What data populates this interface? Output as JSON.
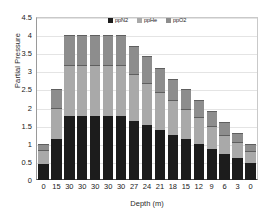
{
  "chart_data": {
    "type": "bar",
    "stacked": true,
    "title": "",
    "xlabel": "Depth (m)",
    "ylabel": "Partial Pressure",
    "ylim": [
      0,
      4.5
    ],
    "ytick_step": 0.5,
    "yticks": [
      "0",
      "0.5",
      "1",
      "1.5",
      "2",
      "2.5",
      "3",
      "3.5",
      "4",
      "4.5"
    ],
    "grid": true,
    "grid_axis": "y",
    "legend_position": "top-center",
    "categories": [
      "0",
      "15",
      "30",
      "30",
      "30",
      "30",
      "30",
      "27",
      "24",
      "21",
      "18",
      "15",
      "12",
      "9",
      "6",
      "3",
      "0"
    ],
    "series": [
      {
        "name": "ppN2",
        "color": "#1c1c1c",
        "values": [
          0.45,
          1.12,
          1.78,
          1.78,
          1.78,
          1.78,
          1.78,
          1.64,
          1.52,
          1.38,
          1.24,
          1.12,
          0.99,
          0.86,
          0.73,
          0.6,
          0.46
        ]
      },
      {
        "name": "ppHe",
        "color": "#a9a9a9",
        "values": [
          0.39,
          0.86,
          1.4,
          1.4,
          1.4,
          1.4,
          1.4,
          1.28,
          1.15,
          1.06,
          0.96,
          0.85,
          0.74,
          0.63,
          0.52,
          0.45,
          0.34
        ]
      },
      {
        "name": "ppO2",
        "color": "#8d8d8d",
        "values": [
          0.16,
          0.52,
          0.82,
          0.82,
          0.82,
          0.82,
          0.82,
          0.78,
          0.75,
          0.66,
          0.6,
          0.53,
          0.47,
          0.41,
          0.35,
          0.25,
          0.2
        ]
      }
    ],
    "totals": [
      1.0,
      2.5,
      4.0,
      4.0,
      4.0,
      4.0,
      4.0,
      3.7,
      3.42,
      3.1,
      2.8,
      2.5,
      2.2,
      1.9,
      1.6,
      1.3,
      1.0
    ]
  }
}
